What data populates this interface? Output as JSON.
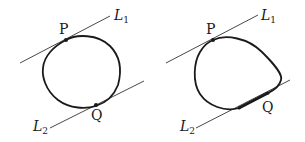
{
  "figures": [
    {
      "id": "left",
      "description": "Convex curve touching parallel lines at single points",
      "line1": {
        "name": "L",
        "sub": "1"
      },
      "line2": {
        "name": "L",
        "sub": "2"
      },
      "point_top": "P",
      "point_bottom": "Q"
    },
    {
      "id": "right",
      "description": "Convex curve touching L2 along a segment",
      "line1": {
        "name": "L",
        "sub": "1"
      },
      "line2": {
        "name": "L",
        "sub": "2"
      },
      "point_top": "P",
      "point_bottom": "Q"
    }
  ],
  "colors": {
    "stroke": "#1a1a1a",
    "line": "#333333",
    "background": "#ffffff"
  }
}
